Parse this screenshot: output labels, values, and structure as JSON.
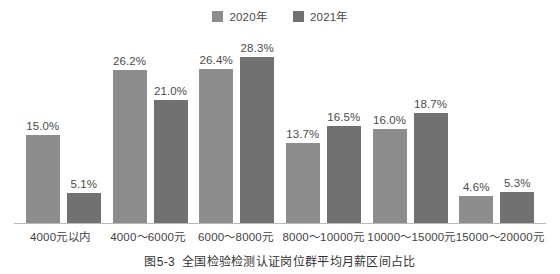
{
  "chart_data": {
    "type": "bar",
    "title": "",
    "caption_number": "图5-3",
    "caption_text": "全国检验检测认证岗位群平均月薪区间占比",
    "xlabel": "",
    "ylabel": "",
    "ylim": [
      0,
      30
    ],
    "grid": false,
    "legend_position": "top-center",
    "value_suffix": "%",
    "categories": [
      "4000元以内",
      "4000～6000元",
      "6000～8000元",
      "8000～10000元",
      "10000～15000元",
      "15000～20000元"
    ],
    "series": [
      {
        "name": "2020年",
        "color": "#8d8d8d",
        "values": [
          15.0,
          26.2,
          26.4,
          13.7,
          16.0,
          4.6
        ],
        "labels": [
          "15.0%",
          "26.2%",
          "26.4%",
          "13.7%",
          "16.0%",
          "4.6%"
        ]
      },
      {
        "name": "2021年",
        "color": "#717171",
        "values": [
          5.1,
          21.0,
          28.3,
          16.5,
          18.7,
          5.3
        ],
        "labels": [
          "5.1%",
          "21.0%",
          "28.3%",
          "16.5%",
          "18.7%",
          "5.3%"
        ]
      }
    ]
  },
  "legend": {
    "items": [
      {
        "label": "2020年",
        "color": "#8d8d8d"
      },
      {
        "label": "2021年",
        "color": "#717171"
      }
    ]
  },
  "axis": {
    "line_color": "#b9b9b9"
  }
}
